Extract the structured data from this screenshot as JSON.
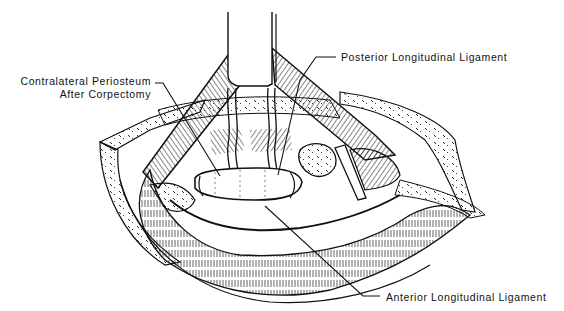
{
  "figure": {
    "type": "surgical-illustration",
    "style": "black-and-white line drawing",
    "labels": {
      "contralateral_line1": "Contralateral Periosteum",
      "contralateral_line2": "After Corpectomy",
      "posterior": "Posterior Longitudinal Ligament",
      "anterior": "Anterior Longitudinal Ligament"
    },
    "colors": {
      "ink": "#111111",
      "paper": "#ffffff"
    }
  }
}
